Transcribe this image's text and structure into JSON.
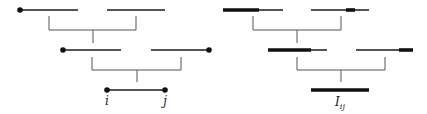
{
  "figure": {
    "colors": {
      "line": "#1a1a1a",
      "thick": "#111111",
      "bracket": "#555555"
    }
  },
  "left": {
    "segments": [
      {
        "x1": 20,
        "x2": 78,
        "y": 10,
        "dots": [
          20
        ]
      },
      {
        "x1": 107,
        "x2": 165,
        "y": 10,
        "dots": []
      },
      {
        "x1": 63,
        "x2": 121,
        "y": 50,
        "dots": [
          63
        ]
      },
      {
        "x1": 151,
        "x2": 209,
        "y": 50,
        "dots": [
          209
        ]
      },
      {
        "x1": 107,
        "x2": 165,
        "y": 90,
        "dots": [
          107,
          165
        ]
      }
    ],
    "brackets": [
      {
        "xl": 49,
        "xr": 136,
        "ytop": 16,
        "ybar": 30,
        "xstem": 93,
        "ystem": 43
      },
      {
        "xl": 92,
        "xr": 181,
        "ytop": 57,
        "ybar": 70,
        "xstem": 137,
        "ystem": 82
      }
    ],
    "labels": [
      {
        "text": "i",
        "x": 107,
        "y": 95
      },
      {
        "text": "j",
        "x": 165,
        "y": 95
      }
    ]
  },
  "right": {
    "segments": [
      {
        "x1": 223,
        "x2": 283,
        "y": 10,
        "thick": [
          [
            223,
            259
          ]
        ]
      },
      {
        "x1": 311,
        "x2": 369,
        "y": 10,
        "thick": [
          [
            346,
            355
          ]
        ]
      },
      {
        "x1": 268,
        "x2": 327,
        "y": 50,
        "thick": [
          [
            268,
            311
          ]
        ]
      },
      {
        "x1": 356,
        "x2": 413,
        "y": 50,
        "thick": [
          [
            399,
            413
          ]
        ]
      },
      {
        "x1": 311,
        "x2": 369,
        "y": 90,
        "thick": [
          [
            311,
            369
          ]
        ]
      }
    ],
    "brackets": [
      {
        "xl": 253,
        "xr": 341,
        "ytop": 16,
        "ybar": 30,
        "xstem": 297,
        "ystem": 43
      },
      {
        "xl": 297,
        "xr": 385,
        "ytop": 57,
        "ybar": 70,
        "xstem": 341,
        "ystem": 82
      }
    ],
    "label": {
      "main": "I",
      "sub": "ij",
      "x": 340,
      "y": 96
    }
  }
}
